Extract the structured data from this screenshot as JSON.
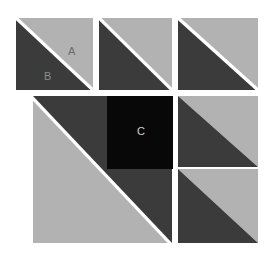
{
  "figure": {
    "canvas": {
      "width": 271,
      "height": 255,
      "background": "#ffffff"
    },
    "palette": {
      "light_gray": "#b2b2b2",
      "dark_gray": "#3b3b3b",
      "black": "#080808",
      "gap_white": "#ffffff",
      "label_light": "#cfcfcf",
      "label_dark": "#6a6a6a"
    },
    "tiles": [
      {
        "id": "tile-top-left",
        "name": "split-square-top-left",
        "kind": "split-square",
        "diagonal": "tl-br",
        "gap": true,
        "upper_right_fill": "#b2b2b2",
        "lower_left_fill": "#3b3b3b",
        "x": 16,
        "y": 18,
        "w": 77,
        "h": 72,
        "labels": [
          {
            "text": "A",
            "x": 52,
            "y": 28,
            "color": "#6a6a6a"
          },
          {
            "text": "B",
            "x": 28,
            "y": 53,
            "color": "#8d8d8d"
          }
        ]
      },
      {
        "id": "tile-top-mid",
        "name": "split-square-top-middle",
        "kind": "split-square",
        "diagonal": "tl-br",
        "gap": true,
        "upper_right_fill": "#b2b2b2",
        "lower_left_fill": "#3b3b3b",
        "x": 99,
        "y": 18,
        "w": 73,
        "h": 72,
        "labels": []
      },
      {
        "id": "tile-top-right",
        "name": "split-square-top-right",
        "kind": "split-square",
        "diagonal": "tl-br",
        "gap": true,
        "upper_right_fill": "#b2b2b2",
        "lower_left_fill": "#3b3b3b",
        "x": 178,
        "y": 18,
        "w": 80,
        "h": 72,
        "labels": []
      },
      {
        "id": "tile-large-left",
        "name": "split-square-large-left",
        "kind": "split-square",
        "diagonal": "tr-bl",
        "gap": true,
        "upper_right_fill": "#3b3b3b",
        "lower_left_fill": "#b2b2b2",
        "x": 33,
        "y": 96,
        "w": 139,
        "h": 147,
        "labels": []
      },
      {
        "id": "tile-center-black",
        "name": "solid-square-center",
        "kind": "solid-square",
        "fill": "#080808",
        "x": 107,
        "y": 96,
        "w": 66,
        "h": 73,
        "labels": [
          {
            "text": "C",
            "x": 30,
            "y": 30,
            "color": "#cfcfcf"
          }
        ]
      },
      {
        "id": "tile-right-mid",
        "name": "split-square-right-middle",
        "kind": "split-square",
        "diagonal": "tl-br",
        "gap": false,
        "upper_right_fill": "#b2b2b2",
        "lower_left_fill": "#3b3b3b",
        "x": 178,
        "y": 96,
        "w": 80,
        "h": 71,
        "labels": []
      },
      {
        "id": "tile-right-bottom",
        "name": "split-square-right-bottom",
        "kind": "split-square",
        "diagonal": "tl-br",
        "gap": false,
        "upper_right_fill": "#b2b2b2",
        "lower_left_fill": "#3b3b3b",
        "x": 178,
        "y": 169,
        "w": 80,
        "h": 74,
        "labels": []
      }
    ],
    "labels_legend": {
      "A": "A",
      "B": "B",
      "C": "C"
    }
  }
}
